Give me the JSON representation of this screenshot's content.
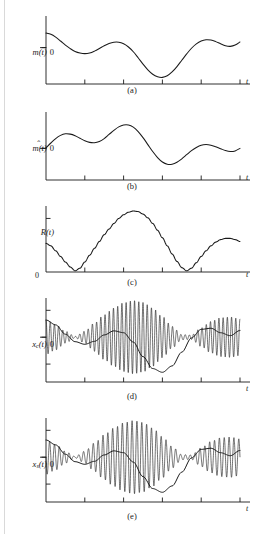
{
  "figure": {
    "background_color": "#ffffff",
    "line_color": "#1a1a1a",
    "panel_count": 5
  },
  "panels": [
    {
      "id": "a",
      "caption": "(a)",
      "y_label_main": "m(t)",
      "y_label_zero": "0",
      "x_label": "t",
      "has_hat": false,
      "zero_position": "mid",
      "x_tick_count": 5,
      "y_tick_count": 1,
      "signal_type": "message"
    },
    {
      "id": "b",
      "caption": "(b)",
      "y_label_main": "m(t)",
      "y_label_zero": "0",
      "x_label": "t",
      "has_hat": true,
      "zero_position": "mid",
      "x_tick_count": 5,
      "y_tick_count": 1,
      "signal_type": "hilbert-transform"
    },
    {
      "id": "c",
      "caption": "(c)",
      "y_label_main": "R(t)",
      "y_label_zero": "0",
      "x_label": "t",
      "has_hat": false,
      "zero_position": "baseline",
      "x_tick_count": 4,
      "y_tick_count": 1,
      "signal_type": "envelope"
    },
    {
      "id": "d",
      "caption": "(d)",
      "y_label_main": "x",
      "y_label_sub": "c",
      "y_label_tail": "(t)",
      "y_label_zero": "0",
      "x_label": "t",
      "has_hat": false,
      "zero_position": "mid",
      "x_tick_count": 5,
      "y_tick_count": 3,
      "signal_type": "modulated-carrier"
    },
    {
      "id": "e",
      "caption": "(e)",
      "y_label_main": "x",
      "y_label_sub": "s",
      "y_label_tail": "(t)",
      "y_label_zero": "0",
      "x_label": "t",
      "has_hat": false,
      "zero_position": "mid",
      "x_tick_count": 5,
      "y_tick_count": 3,
      "signal_type": "modulated-carrier"
    }
  ],
  "chart_data": {
    "type": "line",
    "title": "",
    "xlabel": "t",
    "ylabel": "",
    "grid": false,
    "legend": "none",
    "charts": [
      {
        "panel": "a",
        "name": "m(t)",
        "ylabel": "m(t)",
        "xlim": [
          0,
          1
        ],
        "ylim": [
          -1.15,
          1.0
        ],
        "zero_line": 0,
        "x_ticks": [
          0.2,
          0.4,
          0.6,
          0.8,
          1.0
        ],
        "series": [
          {
            "name": "m(t)",
            "x": [
              0.0,
              0.025,
              0.05,
              0.075,
              0.1,
              0.125,
              0.15,
              0.175,
              0.2,
              0.225,
              0.25,
              0.275,
              0.3,
              0.325,
              0.35,
              0.375,
              0.4,
              0.425,
              0.45,
              0.475,
              0.5,
              0.525,
              0.55,
              0.575,
              0.6,
              0.625,
              0.65,
              0.675,
              0.7,
              0.725,
              0.75,
              0.775,
              0.8,
              0.825,
              0.85,
              0.875,
              0.9,
              0.925,
              0.95,
              0.975,
              1.0
            ],
            "y": [
              0.46,
              0.42,
              0.33,
              0.21,
              0.08,
              -0.03,
              -0.12,
              -0.17,
              -0.19,
              -0.17,
              -0.11,
              -0.03,
              0.06,
              0.13,
              0.17,
              0.17,
              0.12,
              0.02,
              -0.13,
              -0.32,
              -0.52,
              -0.7,
              -0.84,
              -0.92,
              -0.94,
              -0.89,
              -0.77,
              -0.6,
              -0.4,
              -0.2,
              -0.02,
              0.12,
              0.21,
              0.25,
              0.24,
              0.19,
              0.12,
              0.06,
              0.04,
              0.08,
              0.18
            ]
          }
        ]
      },
      {
        "panel": "b",
        "name": "m-hat(t)",
        "ylabel": "m̂(t)",
        "xlim": [
          0,
          1
        ],
        "ylim": [
          -1.0,
          1.0
        ],
        "zero_line": 0,
        "x_ticks": [
          0.2,
          0.4,
          0.6,
          0.8,
          1.0
        ],
        "series": [
          {
            "name": "m-hat(t)",
            "x": [
              0.0,
              0.025,
              0.05,
              0.075,
              0.1,
              0.125,
              0.15,
              0.175,
              0.2,
              0.225,
              0.25,
              0.275,
              0.3,
              0.325,
              0.35,
              0.375,
              0.4,
              0.425,
              0.45,
              0.475,
              0.5,
              0.525,
              0.55,
              0.575,
              0.6,
              0.625,
              0.65,
              0.675,
              0.7,
              0.725,
              0.75,
              0.775,
              0.8,
              0.825,
              0.85,
              0.875,
              0.9,
              0.925,
              0.95,
              0.975,
              1.0
            ],
            "y": [
              0.02,
              0.17,
              0.31,
              0.41,
              0.46,
              0.45,
              0.4,
              0.32,
              0.24,
              0.19,
              0.18,
              0.22,
              0.31,
              0.44,
              0.57,
              0.68,
              0.74,
              0.74,
              0.67,
              0.53,
              0.34,
              0.12,
              -0.1,
              -0.29,
              -0.43,
              -0.5,
              -0.5,
              -0.44,
              -0.33,
              -0.2,
              -0.07,
              0.03,
              0.1,
              0.12,
              0.1,
              0.05,
              -0.01,
              -0.07,
              -0.1,
              -0.08,
              0.0
            ]
          }
        ]
      },
      {
        "panel": "c",
        "name": "R(t)",
        "ylabel": "R(t)",
        "xlim": [
          0,
          1
        ],
        "ylim": [
          0,
          1.05
        ],
        "zero_line": 0,
        "x_ticks": [
          0.2,
          0.4,
          0.6,
          0.8
        ],
        "note": "R(t) = sqrt(m(t)^2 + m-hat(t)^2), the envelope; touches zero at two cusps.",
        "series": [
          {
            "name": "R(t)",
            "x": [
              0.0,
              0.025,
              0.05,
              0.075,
              0.1,
              0.125,
              0.15,
              0.175,
              0.2,
              0.225,
              0.25,
              0.275,
              0.3,
              0.325,
              0.35,
              0.375,
              0.4,
              0.425,
              0.45,
              0.475,
              0.5,
              0.525,
              0.55,
              0.575,
              0.6,
              0.625,
              0.65,
              0.675,
              0.7,
              0.725,
              0.75,
              0.775,
              0.8,
              0.825,
              0.85,
              0.875,
              0.9,
              0.925,
              0.95,
              0.975,
              1.0
            ],
            "y": [
              0.46,
              0.42,
              0.34,
              0.25,
              0.16,
              0.08,
              0.02,
              0.06,
              0.16,
              0.27,
              0.38,
              0.49,
              0.6,
              0.69,
              0.78,
              0.86,
              0.92,
              0.96,
              0.98,
              0.97,
              0.93,
              0.87,
              0.78,
              0.67,
              0.55,
              0.42,
              0.29,
              0.17,
              0.07,
              0.02,
              0.06,
              0.15,
              0.25,
              0.34,
              0.42,
              0.48,
              0.52,
              0.54,
              0.54,
              0.52,
              0.49
            ]
          }
        ]
      },
      {
        "panel": "d",
        "name": "x_c(t)",
        "ylabel": "x_c(t)",
        "xlim": [
          0,
          1
        ],
        "ylim": [
          -1.15,
          1.0
        ],
        "zero_line": 0,
        "x_ticks": [
          0.2,
          0.4,
          0.6,
          0.8,
          1.0
        ],
        "carrier_cycles": 46,
        "note": "High-frequency carrier amplitude-shaped by the envelope; the slowly varying m(t)-like curve is visible through the oscillation.",
        "series": [
          {
            "name": "envelope",
            "x": [
              0.0,
              0.05,
              0.1,
              0.15,
              0.2,
              0.25,
              0.3,
              0.35,
              0.4,
              0.45,
              0.5,
              0.55,
              0.6,
              0.65,
              0.7,
              0.75,
              0.8,
              0.85,
              0.9,
              0.95,
              1.0
            ],
            "y": [
              0.46,
              0.34,
              0.16,
              0.02,
              0.16,
              0.38,
              0.6,
              0.78,
              0.92,
              0.98,
              0.93,
              0.78,
              0.55,
              0.29,
              0.07,
              0.06,
              0.25,
              0.42,
              0.52,
              0.54,
              0.49
            ]
          },
          {
            "name": "inner-curve",
            "x": [
              0.0,
              0.05,
              0.1,
              0.15,
              0.2,
              0.25,
              0.3,
              0.35,
              0.4,
              0.45,
              0.5,
              0.55,
              0.6,
              0.65,
              0.7,
              0.75,
              0.8,
              0.85,
              0.9,
              0.95,
              1.0
            ],
            "y": [
              0.46,
              0.33,
              0.08,
              -0.12,
              -0.19,
              -0.11,
              0.06,
              0.17,
              0.12,
              -0.13,
              -0.52,
              -0.84,
              -0.94,
              -0.77,
              -0.4,
              -0.02,
              0.21,
              0.24,
              0.12,
              0.04,
              0.18
            ]
          }
        ]
      },
      {
        "panel": "e",
        "name": "x_s(t)",
        "ylabel": "x_s(t)",
        "xlim": [
          0,
          1
        ],
        "ylim": [
          -1.15,
          1.0
        ],
        "zero_line": 0,
        "x_ticks": [
          0.2,
          0.4,
          0.6,
          0.8,
          1.0
        ],
        "carrier_cycles": 40,
        "note": "Companion modulated signal with slightly lower carrier frequency than panel (d).",
        "series": [
          {
            "name": "envelope",
            "x": [
              0.0,
              0.05,
              0.1,
              0.15,
              0.2,
              0.25,
              0.3,
              0.35,
              0.4,
              0.45,
              0.5,
              0.55,
              0.6,
              0.65,
              0.7,
              0.75,
              0.8,
              0.85,
              0.9,
              0.95,
              1.0
            ],
            "y": [
              0.46,
              0.34,
              0.16,
              0.02,
              0.16,
              0.38,
              0.6,
              0.78,
              0.92,
              0.98,
              0.93,
              0.78,
              0.55,
              0.29,
              0.07,
              0.06,
              0.25,
              0.42,
              0.52,
              0.54,
              0.49
            ]
          },
          {
            "name": "inner-curve",
            "x": [
              0.0,
              0.05,
              0.1,
              0.15,
              0.2,
              0.25,
              0.3,
              0.35,
              0.4,
              0.45,
              0.5,
              0.55,
              0.6,
              0.65,
              0.7,
              0.75,
              0.8,
              0.85,
              0.9,
              0.95,
              1.0
            ],
            "y": [
              0.46,
              0.33,
              0.08,
              -0.12,
              -0.19,
              -0.11,
              0.06,
              0.17,
              0.12,
              -0.13,
              -0.52,
              -0.84,
              -0.94,
              -0.77,
              -0.4,
              -0.02,
              0.21,
              0.24,
              0.12,
              0.04,
              0.18
            ]
          }
        ]
      }
    ]
  }
}
